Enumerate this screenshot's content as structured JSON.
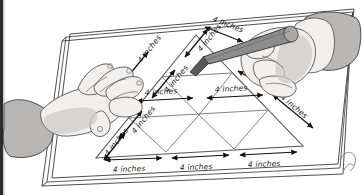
{
  "scene": {
    "title": "Hands drawing a subdivided triangle on a board",
    "background_color": "#ffffff",
    "width": 362,
    "height": 195
  },
  "board": {
    "name": "drawing-board",
    "frame_color": "#3a3a3a",
    "surface_color": "#ffffff"
  },
  "figure": {
    "shape": "large triangle subdivided into 9 smaller triangles",
    "rows": 3,
    "small_triangle_count": 9,
    "outline_color": "#555555",
    "grid_color": "#6d6d6d"
  },
  "dimension_label": "4 inches",
  "labels": {
    "left_edge": [
      {
        "id": "left-1",
        "text": "4 inches"
      },
      {
        "id": "left-2",
        "text": "4 inches"
      },
      {
        "id": "left-3",
        "text": "4 inches"
      }
    ],
    "right_edge": [
      {
        "id": "right-1",
        "text": "4 inches"
      },
      {
        "id": "right-2",
        "text": "4 inches"
      },
      {
        "id": "right-3",
        "text": "4 inches"
      }
    ],
    "bottom_edge": [
      {
        "id": "bottom-1",
        "text": "4 inches"
      },
      {
        "id": "bottom-2",
        "text": "4 inches"
      },
      {
        "id": "bottom-3",
        "text": "4 inches"
      }
    ],
    "middle_row": [
      {
        "id": "middle-1",
        "text": "4 inches"
      },
      {
        "id": "middle-2",
        "text": "4 inches"
      }
    ]
  },
  "hands": {
    "left": {
      "name": "left-hand",
      "description": "open hand resting on board",
      "skin_color": "#f1eeec",
      "sleeve_color": "#b9b6b4"
    },
    "right": {
      "name": "right-hand",
      "description": "hand holding pencil",
      "skin_color": "#f1eeec",
      "sleeve_color": "#b9b6b4"
    }
  },
  "pencil": {
    "name": "pencil",
    "body_color": "#8c8c8c",
    "tip_color": "#585858"
  }
}
